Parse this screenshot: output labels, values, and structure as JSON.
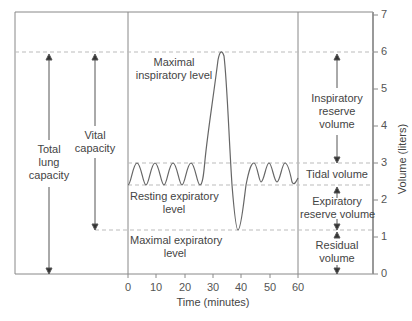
{
  "x_axis": {
    "label": "Time (minutes)",
    "ticks": [
      "0",
      "10",
      "20",
      "30",
      "40",
      "50",
      "60"
    ]
  },
  "y_axis": {
    "label": "Volume (liters)",
    "ticks": [
      "0",
      "1",
      "2",
      "3",
      "4",
      "5",
      "6",
      "7"
    ]
  },
  "levels": {
    "maximal_inspiratory": {
      "label_1": "Maximal",
      "label_2": "inspiratory level",
      "value": 6.0
    },
    "resting_expiratory": {
      "label_1": "Resting expiratory",
      "label_2": "level",
      "value": 2.4
    },
    "maximal_expiratory": {
      "label_1": "Maximal expiratory",
      "label_2": "level",
      "value": 1.2
    },
    "tidal_top": {
      "value": 3.0
    }
  },
  "capacities": {
    "total_lung_capacity": {
      "l1": "Total",
      "l2": "lung",
      "l3": "capacity",
      "from": 0,
      "to": 6
    },
    "vital_capacity": {
      "l1": "Vital",
      "l2": "capacity",
      "from": 1.2,
      "to": 6
    }
  },
  "volumes": {
    "inspiratory_reserve": {
      "l1": "Inspiratory",
      "l2": "reserve",
      "l3": "volume",
      "from": 3.0,
      "to": 6.0
    },
    "tidal": {
      "l1": "Tidal volume",
      "from": 2.4,
      "to": 3.0
    },
    "expiratory_reserve": {
      "l1": "Expiratory",
      "l2": "reserve volume",
      "from": 1.2,
      "to": 2.4
    },
    "residual": {
      "l1": "Residual",
      "l2": "volume",
      "from": 0,
      "to": 1.2
    }
  },
  "colors": {
    "line": "#666666",
    "dashed": "#bbbbbb",
    "frame": "#777777",
    "text": "#444444"
  }
}
